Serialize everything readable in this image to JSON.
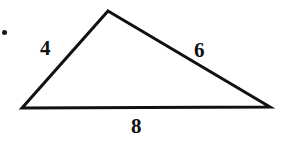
{
  "figure": {
    "kind": "geometry-diagram",
    "shape": "triangle",
    "stroke_color": "#111111",
    "fill_color": "#ffffff",
    "background_color": "#ffffff",
    "stroke_width": 3,
    "canvas": {
      "width": 281,
      "height": 149
    },
    "vertices": {
      "apex": {
        "x": 108,
        "y": 11
      },
      "bottom_left": {
        "x": 22,
        "y": 108
      },
      "bottom_right": {
        "x": 270,
        "y": 107
      }
    },
    "polygon_points": "108,11 270,107 22,108",
    "sides": [
      {
        "name": "left-side",
        "label": "4",
        "from": "bottom_left",
        "to": "apex"
      },
      {
        "name": "right-side",
        "label": "6",
        "from": "apex",
        "to": "bottom_right"
      },
      {
        "name": "base",
        "label": "8",
        "from": "bottom_left",
        "to": "bottom_right"
      }
    ],
    "labels": {
      "left": "4",
      "right": "6",
      "base": "8"
    },
    "bullet": {
      "present": true,
      "color": "#161616",
      "x": 2,
      "y": 30,
      "size": 5
    }
  }
}
